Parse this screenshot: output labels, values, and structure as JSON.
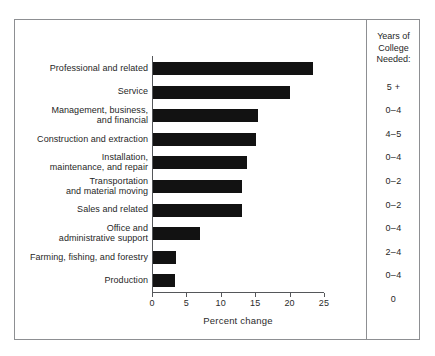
{
  "chart_data": {
    "type": "bar",
    "orientation": "horizontal",
    "title": "",
    "xlabel": "Percent change",
    "ylabel": "",
    "xlim": [
      0,
      25
    ],
    "xticks": [
      0,
      5,
      10,
      15,
      20,
      25
    ],
    "xtick_labels": [
      "0",
      "5",
      "10",
      "15",
      "20",
      "25"
    ],
    "grid": false,
    "legend": null,
    "bar_color": "#121212",
    "categories": [
      "Professional and related",
      "Service",
      "Management, business, and financial",
      "Construction and extraction",
      "Installation, maintenance, and repair",
      "Transportation and material moving",
      "Sales and related",
      "Office and administrative support",
      "Farming, fishing, and forestry",
      "Production"
    ],
    "values": [
      23.3,
      19.9,
      15.3,
      15.0,
      13.6,
      13.0,
      12.9,
      6.8,
      3.4,
      3.2
    ],
    "annotations": {
      "right_column_header": "Years of College Needed:",
      "right_column_values": [
        "5 +",
        "0–4",
        "4–5",
        "0–4",
        "0–2",
        "0–2",
        "0–4",
        "2–4",
        "0–4",
        "0"
      ]
    }
  },
  "rows": [
    {
      "label_lines": [
        "Professional and related"
      ],
      "value": 23.3,
      "years": "5 +"
    },
    {
      "label_lines": [
        "Service"
      ],
      "value": 19.9,
      "years": "0–4"
    },
    {
      "label_lines": [
        "Management, business,",
        "and financial"
      ],
      "value": 15.3,
      "years": "4–5"
    },
    {
      "label_lines": [
        "Construction and extraction"
      ],
      "value": 15.0,
      "years": "0–4"
    },
    {
      "label_lines": [
        "Installation,",
        "maintenance, and repair"
      ],
      "value": 13.6,
      "years": "0–2"
    },
    {
      "label_lines": [
        "Transportation",
        "and material moving"
      ],
      "value": 13.0,
      "years": "0–2"
    },
    {
      "label_lines": [
        "Sales and related"
      ],
      "value": 12.9,
      "years": "0–4"
    },
    {
      "label_lines": [
        "Office and",
        "administrative support"
      ],
      "value": 6.8,
      "years": "2–4"
    },
    {
      "label_lines": [
        "Farming, fishing, and forestry"
      ],
      "value": 3.4,
      "years": "0–4"
    },
    {
      "label_lines": [
        "Production"
      ],
      "value": 3.2,
      "years": "0"
    }
  ],
  "axis": {
    "title": "Percent change",
    "tick_labels": [
      "0",
      "5",
      "10",
      "15",
      "20",
      "25"
    ]
  },
  "right_column": {
    "header_lines": [
      "Years of",
      "College",
      "Needed:"
    ]
  }
}
